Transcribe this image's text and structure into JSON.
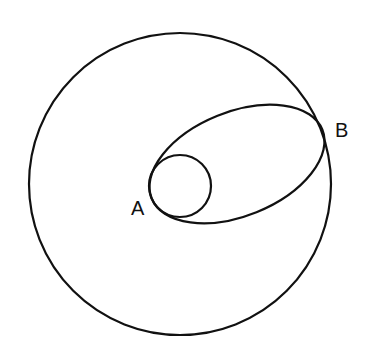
{
  "diagram": {
    "stroke_color": "#111111",
    "background": "#ffffff",
    "labels": {
      "a": "A",
      "b": "B"
    },
    "shapes": {
      "outer_circle": {
        "cx": 180,
        "cy": 184,
        "r": 151
      },
      "inner_circle": {
        "cx": 180,
        "cy": 186,
        "r": 31
      },
      "ellipse": {
        "cx": 237,
        "cy": 164,
        "rx": 92,
        "ry": 52,
        "rotation_deg": -22
      }
    }
  }
}
